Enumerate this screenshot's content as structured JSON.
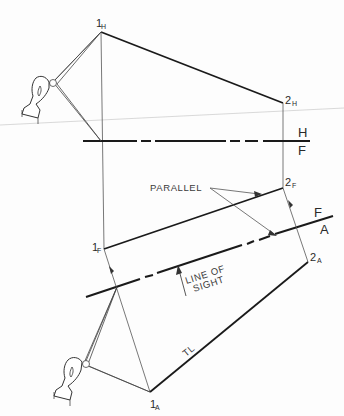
{
  "figure": {
    "type": "descriptive-geometry auxiliary view construction",
    "colors": {
      "line": "#1a1a1a",
      "projector": "#555555",
      "crease": "#c8c8c8",
      "paper": "#fdfdfd"
    }
  },
  "points": {
    "p1H": {
      "main": "1",
      "sub": "H"
    },
    "p2H": {
      "main": "2",
      "sub": "H"
    },
    "p1F": {
      "main": "1",
      "sub": "F"
    },
    "p2F": {
      "main": "2",
      "sub": "F"
    },
    "p1A": {
      "main": "1",
      "sub": "A"
    },
    "p2A": {
      "main": "2",
      "sub": "A"
    }
  },
  "fold_lines": {
    "hf": {
      "upper": "H",
      "lower": "F"
    },
    "fa": {
      "upper": "F",
      "lower": "A"
    }
  },
  "annotations": {
    "parallel": "PARALLEL",
    "line_of_sight_1": "LINE OF",
    "line_of_sight_2": "SIGHT",
    "true_length": "TL"
  },
  "icons": {
    "hand_dividers_top": "hand-with-dividers-icon",
    "hand_dividers_bottom": "hand-with-dividers-icon"
  }
}
